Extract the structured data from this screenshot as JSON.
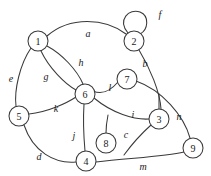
{
  "figure": {
    "background_color": "#ffffff",
    "stroke_color": "#3a3a3a",
    "label_color": "#1a1a1a",
    "width": 211,
    "height": 176
  },
  "graph": {
    "type": "undirected-multigraph",
    "nodes": [
      {
        "id": "n1",
        "label": "1",
        "cx": 38,
        "cy": 41,
        "r": 10
      },
      {
        "id": "n2",
        "label": "2",
        "cx": 134,
        "cy": 41,
        "r": 10
      },
      {
        "id": "n3",
        "label": "3",
        "cx": 159,
        "cy": 119,
        "r": 10
      },
      {
        "id": "n4",
        "label": "4",
        "cx": 86,
        "cy": 161,
        "r": 10
      },
      {
        "id": "n5",
        "label": "5",
        "cx": 19,
        "cy": 116,
        "r": 10
      },
      {
        "id": "n6",
        "label": "6",
        "cx": 85,
        "cy": 94,
        "r": 10
      },
      {
        "id": "n7",
        "label": "7",
        "cx": 127,
        "cy": 79,
        "r": 10
      },
      {
        "id": "n8",
        "label": "8",
        "cx": 106,
        "cy": 143,
        "r": 10
      },
      {
        "id": "n9",
        "label": "9",
        "cx": 193,
        "cy": 148,
        "r": 10
      }
    ],
    "edges": [
      {
        "id": "ea",
        "label": "a",
        "from": "n1",
        "to": "n2",
        "label_x": 88,
        "label_y": 33,
        "path": "M 47 36 C 70 16 105 18 126 34"
      },
      {
        "id": "eb",
        "label": "b",
        "from": "n2",
        "to": "n3",
        "label_x": 145,
        "label_y": 63,
        "path": "M 139 50 C 150 68 160 92 161 109"
      },
      {
        "id": "ec",
        "label": "c",
        "from": "n3",
        "to": "free-end",
        "label_x": 126,
        "label_y": 134,
        "path": "M 151 125 C 141 134 132 144 124 155"
      },
      {
        "id": "ed",
        "label": "d",
        "from": "n5",
        "to": "n4",
        "label_x": 39,
        "label_y": 156,
        "path": "M 24 125 C 33 152 55 164 76 162"
      },
      {
        "id": "ee",
        "label": "e",
        "from": "n1",
        "to": "n5",
        "label_x": 11,
        "label_y": 78,
        "path": "M 31 48 C 20 64 14 90 16 106"
      },
      {
        "id": "ef",
        "label": "f",
        "from": "n2",
        "to": "n2",
        "label_x": 160,
        "label_y": 14,
        "path": "M 128 33 C 117 20 129 8 140 12 C 150 16 148 30 140 34"
      },
      {
        "id": "eg",
        "label": "g",
        "from": "n1",
        "to": "n6",
        "label_x": 46,
        "label_y": 76,
        "path": "M 41 51 C 49 68 65 84 76 90"
      },
      {
        "id": "eh",
        "label": "h",
        "from": "n1",
        "to": "n6",
        "label_x": 81,
        "label_y": 62,
        "path": "M 47 46 C 62 54 77 70 83 84"
      },
      {
        "id": "ei",
        "label": "i",
        "from": "n6",
        "to": "n3",
        "label_x": 133,
        "label_y": 114,
        "path": "M 94 98 C 112 113 134 120 149 119"
      },
      {
        "id": "ej",
        "label": "j",
        "from": "n6",
        "to": "n4",
        "label_x": 74,
        "label_y": 135,
        "path": "M 84 104 C 83 120 84 140 85 151"
      },
      {
        "id": "ek",
        "label": "k",
        "from": "n5",
        "to": "n6",
        "label_x": 56,
        "label_y": 108,
        "path": "M 29 114 C 48 112 67 103 76 97"
      },
      {
        "id": "el",
        "label": "l",
        "from": "n6",
        "to": "n7",
        "label_x": 110,
        "label_y": 87,
        "path": "M 93 91 C 104 96 112 89 118 82"
      },
      {
        "id": "em",
        "label": "m",
        "from": "n4",
        "to": "n9",
        "label_x": 143,
        "label_y": 166,
        "path": "M 96 162 C 126 158 164 157 184 152"
      },
      {
        "id": "en",
        "label": "n",
        "from": "n7",
        "to": "n9",
        "label_x": 179,
        "label_y": 116,
        "path": "M 136 81 C 162 90 184 116 190 138"
      }
    ],
    "stubs": [
      {
        "id": "s7-3",
        "from": "n7",
        "path": "M 159 109 C 159 102 159 98 159 94"
      },
      {
        "id": "s8",
        "from": "n8",
        "path": "M 106 133 C 106 125 107 120 108 115"
      }
    ]
  }
}
